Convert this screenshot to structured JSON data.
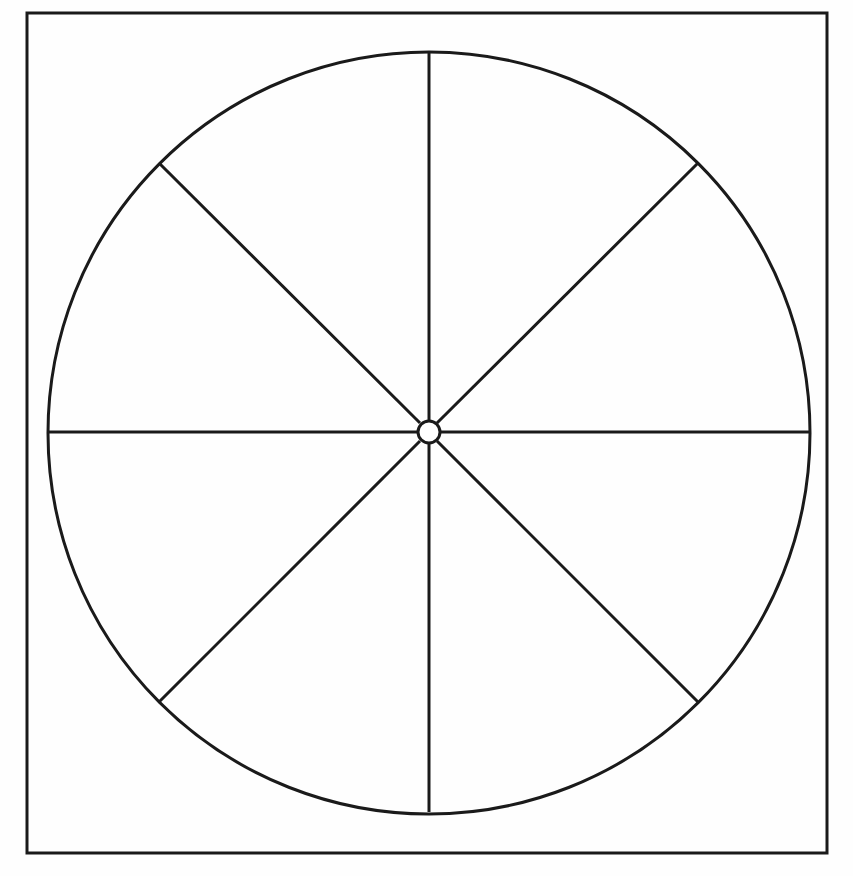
{
  "figure": {
    "type": "line-drawing",
    "canvas": {
      "width": 853,
      "height": 876
    },
    "background_color": "#fefefe",
    "ink_color": "#1a1a1a"
  },
  "frame": {
    "name": "outer rectangular border",
    "x": 27,
    "y": 13,
    "width": 800,
    "height": 840,
    "stroke_color": "#1a1a1a",
    "stroke_width": 3,
    "fill": "none"
  },
  "wheel": {
    "name": "circle rim",
    "center_x": 429,
    "center_y": 433,
    "radius": 381,
    "stroke_color": "#1a1a1a",
    "stroke_width": 3,
    "fill": "none"
  },
  "hub": {
    "name": "center hub circle",
    "center_x": 429,
    "center_y": 432,
    "radius": 11,
    "stroke_color": "#1a1a1a",
    "stroke_width": 3,
    "fill": "#ffffff"
  },
  "spokes": {
    "count": 8,
    "sector_count": 8,
    "angle_step_degrees": 45,
    "inner_radius": 12,
    "outer_radius": 381,
    "stroke_color": "#1a1a1a",
    "stroke_width": 3,
    "items": [
      {
        "label": "spoke-north",
        "angle_degrees": 270,
        "x1": 429,
        "y1": 420,
        "x2": 429,
        "y2": 52
      },
      {
        "label": "spoke-northeast",
        "angle_degrees": 315,
        "x1": 437,
        "y1": 423,
        "x2": 698,
        "y2": 163
      },
      {
        "label": "spoke-east",
        "angle_degrees": 0,
        "x1": 441,
        "y1": 432,
        "x2": 810,
        "y2": 432
      },
      {
        "label": "spoke-southeast",
        "angle_degrees": 45,
        "x1": 437,
        "y1": 441,
        "x2": 698,
        "y2": 702
      },
      {
        "label": "spoke-south",
        "angle_degrees": 90,
        "x1": 429,
        "y1": 444,
        "x2": 429,
        "y2": 812
      },
      {
        "label": "spoke-southwest",
        "angle_degrees": 135,
        "x1": 420,
        "y1": 441,
        "x2": 159,
        "y2": 702
      },
      {
        "label": "spoke-west",
        "angle_degrees": 180,
        "x1": 417,
        "y1": 432,
        "x2": 48,
        "y2": 432
      },
      {
        "label": "spoke-northwest",
        "angle_degrees": 225,
        "x1": 420,
        "y1": 423,
        "x2": 159,
        "y2": 163
      }
    ]
  },
  "sectors": [
    {
      "name": "sector-1",
      "from_degrees": 270,
      "to_degrees": 315
    },
    {
      "name": "sector-2",
      "from_degrees": 315,
      "to_degrees": 0
    },
    {
      "name": "sector-3",
      "from_degrees": 0,
      "to_degrees": 45
    },
    {
      "name": "sector-4",
      "from_degrees": 45,
      "to_degrees": 90
    },
    {
      "name": "sector-5",
      "from_degrees": 90,
      "to_degrees": 135
    },
    {
      "name": "sector-6",
      "from_degrees": 135,
      "to_degrees": 180
    },
    {
      "name": "sector-7",
      "from_degrees": 180,
      "to_degrees": 225
    },
    {
      "name": "sector-8",
      "from_degrees": 225,
      "to_degrees": 270
    }
  ]
}
